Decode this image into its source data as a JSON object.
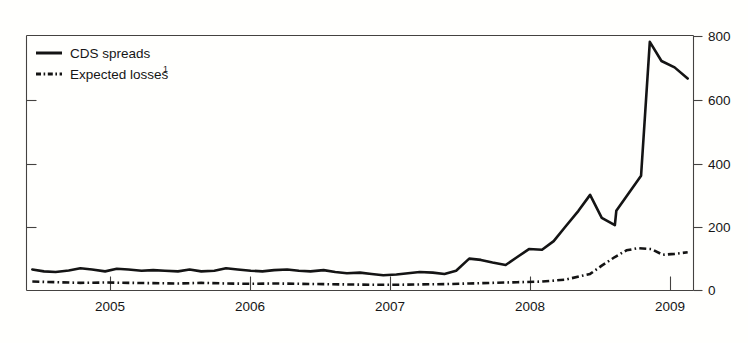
{
  "chart_data": {
    "type": "line",
    "title": "",
    "subtitle": "",
    "xlabel": "",
    "ylabel": "",
    "xlim": [
      2004.5,
      2009.08
    ],
    "ylim": [
      0,
      800
    ],
    "yticks": [
      0,
      200,
      400,
      600,
      800
    ],
    "ytick_labels": [
      "0",
      "200",
      "400",
      "600",
      "800"
    ],
    "y_axis_position": "right",
    "xticks": [
      2005,
      2006,
      2007,
      2008,
      2009
    ],
    "xtick_labels": [
      "2005",
      "2006",
      "2007",
      "2008",
      "2009"
    ],
    "grid": false,
    "legend_position": "top-left",
    "legend": [
      "CDS spreads",
      "Expected losses"
    ],
    "footnote_marker": "1",
    "series": [
      {
        "name": "CDS spreads",
        "style": "solid",
        "x": [
          2004.54,
          2004.62,
          2004.7,
          2004.79,
          2004.87,
          2004.95,
          2005.04,
          2005.12,
          2005.2,
          2005.29,
          2005.37,
          2005.45,
          2005.54,
          2005.62,
          2005.7,
          2005.79,
          2005.87,
          2005.95,
          2006.04,
          2006.12,
          2006.2,
          2006.29,
          2006.37,
          2006.45,
          2006.54,
          2006.62,
          2006.7,
          2006.79,
          2006.87,
          2006.95,
          2007.04,
          2007.12,
          2007.2,
          2007.29,
          2007.37,
          2007.45,
          2007.54,
          2007.62,
          2007.7,
          2007.79,
          2007.87,
          2007.95,
          2008.04,
          2008.12,
          2008.2,
          2008.29,
          2008.37,
          2008.45,
          2008.54,
          2008.62,
          2008.7,
          2008.79,
          2008.87,
          2008.95,
          2009.04
        ],
        "values": [
          66,
          60,
          58,
          63,
          70,
          66,
          60,
          68,
          66,
          62,
          64,
          62,
          60,
          66,
          60,
          62,
          70,
          66,
          62,
          60,
          64,
          66,
          62,
          60,
          64,
          58,
          54,
          56,
          52,
          48,
          50,
          54,
          58,
          56,
          52,
          62,
          100,
          96,
          88,
          80,
          105,
          130,
          128,
          155,
          200,
          250,
          300,
          228,
          205,
          205,
          245,
          235,
          255,
          240,
          290
        ]
      },
      {
        "name": "Expected losses",
        "style": "dash-dot",
        "x": [
          2004.54,
          2004.7,
          2004.87,
          2005.04,
          2005.2,
          2005.37,
          2005.54,
          2005.7,
          2005.87,
          2006.04,
          2006.2,
          2006.37,
          2006.54,
          2006.7,
          2006.87,
          2007.04,
          2007.2,
          2007.37,
          2007.54,
          2007.7,
          2007.87,
          2008.04,
          2008.2,
          2008.37,
          2008.45,
          2008.54,
          2008.62,
          2008.7,
          2008.79,
          2008.87,
          2008.95,
          2009.04
        ],
        "values": [
          28,
          26,
          24,
          25,
          24,
          23,
          22,
          24,
          22,
          21,
          22,
          21,
          20,
          19,
          18,
          18,
          19,
          20,
          22,
          24,
          26,
          28,
          34,
          52,
          78,
          105,
          126,
          133,
          130,
          112,
          115,
          120
        ]
      }
    ],
    "cds_late_segment": {
      "x": [
        2009.04,
        2008.99,
        2008.96
      ],
      "values": [
        290,
        780,
        665
      ],
      "note": "steep spike to peak then decline"
    },
    "cds_spike": {
      "x": [
        2008.55,
        2008.72,
        2008.78,
        2008.86,
        2008.95,
        2009.04
      ],
      "values": [
        250,
        360,
        780,
        720,
        700,
        665
      ]
    }
  },
  "colors": {
    "background": "#fffffd",
    "axis": "#444240",
    "series": "#141414",
    "text": "#161616"
  },
  "legend": {
    "items": [
      {
        "label": "CDS spreads",
        "sup": "",
        "style": "solid"
      },
      {
        "label": "Expected losses",
        "sup": "1",
        "style": "dash-dot"
      }
    ]
  },
  "axes": {
    "y_labels": [
      "800",
      "600",
      "400",
      "200",
      "0"
    ],
    "x_labels": [
      "2005",
      "2006",
      "2007",
      "2008",
      "2009"
    ]
  }
}
